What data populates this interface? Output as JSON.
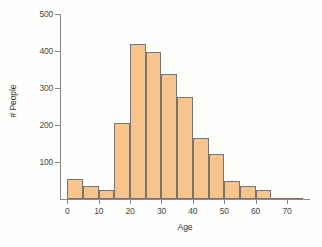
{
  "chart_data": {
    "type": "bar",
    "title": "",
    "subtitle": "",
    "xlabel": "Age",
    "ylabel": "# People",
    "xlim": [
      -2,
      77
    ],
    "ylim": [
      0,
      500
    ],
    "bin_width": 5,
    "grid": false,
    "legend": null,
    "x_ticks": [
      0,
      10,
      20,
      30,
      40,
      50,
      60,
      70
    ],
    "y_ticks": [
      100,
      200,
      300,
      400,
      500
    ],
    "bin_edges": [
      0,
      5,
      10,
      15,
      20,
      25,
      30,
      35,
      40,
      45,
      50,
      55,
      60,
      65,
      70,
      75
    ],
    "categories": [
      "0-5",
      "5-10",
      "10-15",
      "15-20",
      "20-25",
      "25-30",
      "30-35",
      "35-40",
      "40-45",
      "45-50",
      "50-55",
      "55-60",
      "60-65",
      "65-70",
      "70-75"
    ],
    "values": [
      55,
      35,
      25,
      205,
      420,
      398,
      338,
      275,
      165,
      123,
      48,
      35,
      25,
      3,
      2
    ],
    "colors": {
      "bar_fill": "#f6c48c",
      "bar_stroke": "#7d736c",
      "axis": "#8a8a8a",
      "text": "#4a4a4a",
      "background": "#fdfdfc"
    }
  }
}
